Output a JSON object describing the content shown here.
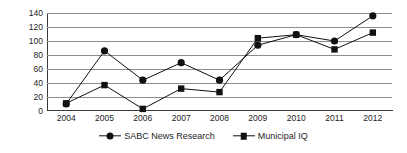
{
  "chart_data": {
    "type": "line",
    "title": "",
    "xlabel": "",
    "ylabel": "",
    "categories": [
      "2004",
      "2005",
      "2006",
      "2007",
      "2008",
      "2009",
      "2010",
      "2011",
      "2012"
    ],
    "ylim": [
      0,
      140
    ],
    "ytick_step": 20,
    "yticks": [
      0,
      20,
      40,
      60,
      80,
      100,
      120,
      140
    ],
    "grid": true,
    "legend_position": "bottom",
    "series": [
      {
        "name": "SABC News Research",
        "marker": "circle",
        "color": "#111111",
        "values": [
          10,
          86,
          44,
          69,
          44,
          94,
          109,
          100,
          136
        ]
      },
      {
        "name": "Municipal IQ",
        "marker": "square",
        "color": "#111111",
        "values": [
          11,
          37,
          3,
          32,
          27,
          104,
          109,
          88,
          112
        ]
      }
    ]
  },
  "legend": {
    "items": [
      {
        "label": "SABC News Research",
        "marker": "circle-marker-icon"
      },
      {
        "label": "Municipal IQ",
        "marker": "square-marker-icon"
      }
    ]
  }
}
